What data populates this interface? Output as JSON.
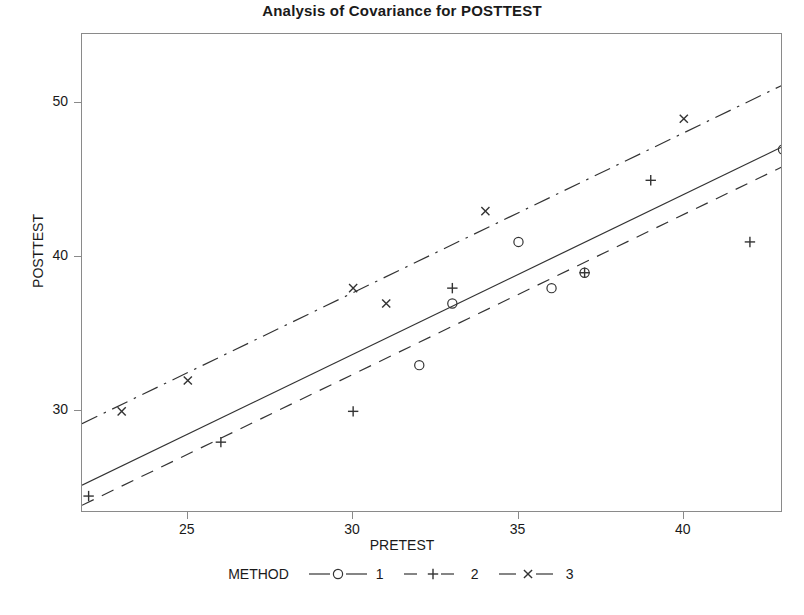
{
  "title": "Analysis of Covariance for POSTTEST",
  "axes": {
    "xlabel": "PRETEST",
    "ylabel": "POSTTEST",
    "xticks": [
      "25",
      "30",
      "35",
      "40"
    ],
    "yticks": [
      "30",
      "40",
      "50"
    ]
  },
  "legend": {
    "title": "METHOD",
    "entries": [
      {
        "label": "1",
        "marker": "circle-marker",
        "line": "solid"
      },
      {
        "label": "2",
        "marker": "plus-marker",
        "line": "dashed"
      },
      {
        "label": "3",
        "marker": "cross-marker",
        "line": "dash-dot"
      }
    ]
  },
  "colors": {
    "ink": "#333333",
    "frame": "#8a8a8a",
    "background": "#ffffff"
  },
  "chart_data": {
    "type": "scatter",
    "title": "Analysis of Covariance for POSTTEST",
    "xlabel": "PRETEST",
    "ylabel": "POSTTEST",
    "xlim": [
      21.8,
      43.0
    ],
    "ylim": [
      23.4,
      54.5
    ],
    "xticks": [
      25,
      30,
      35,
      40
    ],
    "yticks": [
      30,
      40,
      50
    ],
    "grid": false,
    "legend_position": "bottom",
    "legend_title": "METHOD",
    "series": [
      {
        "name": "1",
        "marker": "circle",
        "line_style": "solid",
        "points": [
          {
            "x": 32,
            "y": 33
          },
          {
            "x": 33,
            "y": 37
          },
          {
            "x": 35,
            "y": 41
          },
          {
            "x": 36,
            "y": 38
          },
          {
            "x": 37,
            "y": 39
          },
          {
            "x": 43,
            "y": 47
          }
        ],
        "fit_line": {
          "x1": 21.8,
          "y1": 25.2,
          "x2": 43.0,
          "y2": 47.2
        }
      },
      {
        "name": "2",
        "marker": "plus",
        "line_style": "dashed",
        "points": [
          {
            "x": 22,
            "y": 24.5
          },
          {
            "x": 26,
            "y": 28
          },
          {
            "x": 30,
            "y": 30
          },
          {
            "x": 33,
            "y": 38
          },
          {
            "x": 37,
            "y": 39
          },
          {
            "x": 39,
            "y": 45
          },
          {
            "x": 42,
            "y": 41
          }
        ],
        "fit_line": {
          "x1": 21.8,
          "y1": 23.9,
          "x2": 43.0,
          "y2": 45.9
        }
      },
      {
        "name": "3",
        "marker": "cross",
        "line_style": "dash-dot",
        "points": [
          {
            "x": 23,
            "y": 30
          },
          {
            "x": 25,
            "y": 32
          },
          {
            "x": 30,
            "y": 38
          },
          {
            "x": 31,
            "y": 37
          },
          {
            "x": 34,
            "y": 43
          },
          {
            "x": 40,
            "y": 49
          }
        ],
        "fit_line": {
          "x1": 21.8,
          "y1": 29.2,
          "x2": 43.0,
          "y2": 51.2
        }
      }
    ]
  }
}
